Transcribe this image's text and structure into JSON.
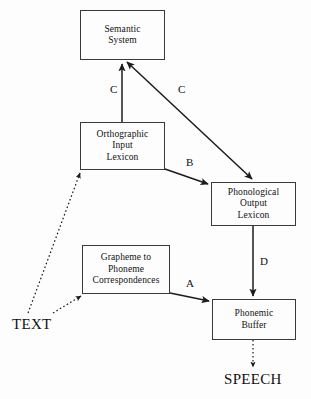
{
  "diagram": {
    "background_color": "#fdfdfd",
    "stroke_color": "#222222",
    "nodes": [
      {
        "id": "semantic-system",
        "label": "Semantic\nSystem",
        "x": 80,
        "y": 10,
        "w": 85,
        "h": 50
      },
      {
        "id": "orthographic-input-lexicon",
        "label": "Orthographic\nInput\nLexicon",
        "x": 80,
        "y": 122,
        "w": 85,
        "h": 48
      },
      {
        "id": "phonological-output-lexicon",
        "label": "Phonological\nOutput\nLexicon",
        "x": 211,
        "y": 182,
        "w": 85,
        "h": 44
      },
      {
        "id": "grapheme-phoneme-correspondences",
        "label": "Grapheme to\nPhoneme\nCorrespondences",
        "x": 82,
        "y": 245,
        "w": 88,
        "h": 49
      },
      {
        "id": "phonemic-buffer",
        "label": "Phonemic\nBuffer",
        "x": 212,
        "y": 299,
        "w": 84,
        "h": 41
      }
    ],
    "terminals": [
      {
        "id": "text",
        "label": "TEXT",
        "x": 12,
        "y": 316
      },
      {
        "id": "speech",
        "label": "SPEECH",
        "x": 224,
        "y": 371
      }
    ],
    "edge_labels": [
      {
        "id": "label-c-left",
        "label": "C",
        "x": 110,
        "y": 84
      },
      {
        "id": "label-c-right",
        "label": "C",
        "x": 178,
        "y": 84
      },
      {
        "id": "label-b",
        "label": "B",
        "x": 186,
        "y": 157
      },
      {
        "id": "label-d",
        "label": "D",
        "x": 260,
        "y": 256
      },
      {
        "id": "label-a",
        "label": "A",
        "x": 186,
        "y": 278
      }
    ],
    "edges": [
      {
        "id": "edge-orthographic-to-semantic",
        "from": "orthographic-input-lexicon",
        "to": "semantic-system",
        "route_label": "C",
        "style": "solid",
        "arrow": "end"
      },
      {
        "id": "edge-semantic-to-phonological",
        "from": "semantic-system",
        "to": "phonological-output-lexicon",
        "route_label": "C",
        "style": "solid",
        "arrow": "both"
      },
      {
        "id": "edge-orthographic-to-phonological",
        "from": "orthographic-input-lexicon",
        "to": "phonological-output-lexicon",
        "route_label": "B",
        "style": "solid",
        "arrow": "end"
      },
      {
        "id": "edge-phonological-to-buffer",
        "from": "phonological-output-lexicon",
        "to": "phonemic-buffer",
        "route_label": "D",
        "style": "solid",
        "arrow": "end"
      },
      {
        "id": "edge-grapheme-to-buffer",
        "from": "grapheme-phoneme-correspondences",
        "to": "phonemic-buffer",
        "route_label": "A",
        "style": "solid",
        "arrow": "end"
      },
      {
        "id": "edge-text-to-orthographic",
        "from": "text",
        "to": "orthographic-input-lexicon",
        "route_label": "",
        "style": "dotted",
        "arrow": "end"
      },
      {
        "id": "edge-text-to-grapheme",
        "from": "text",
        "to": "grapheme-phoneme-correspondences",
        "route_label": "",
        "style": "dotted",
        "arrow": "end"
      },
      {
        "id": "edge-buffer-to-speech",
        "from": "phonemic-buffer",
        "to": "speech",
        "route_label": "",
        "style": "dotted",
        "arrow": "end"
      }
    ]
  }
}
